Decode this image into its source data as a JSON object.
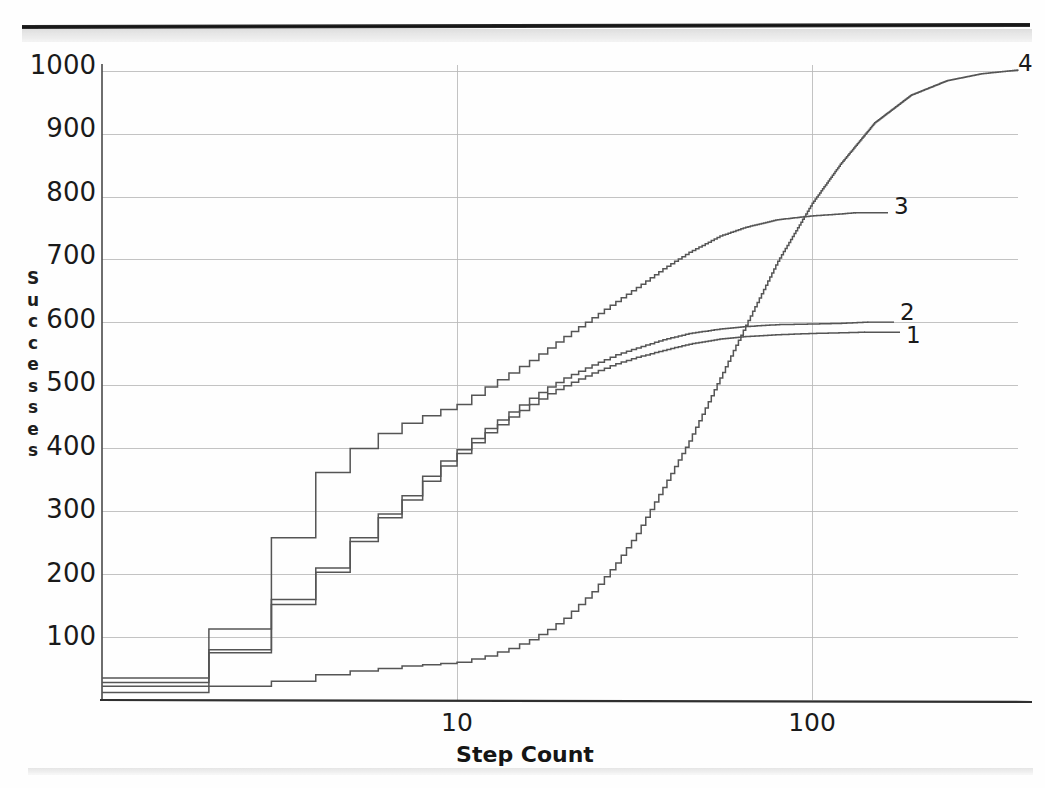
{
  "figure": {
    "type_name": "line-chart",
    "xlabel": "Step Count",
    "ylabel_letters": [
      "S",
      "u",
      "c",
      "c",
      "e",
      "s",
      "s",
      "e",
      "s"
    ],
    "ylabel_text": "Successes"
  },
  "axes": {
    "y_ticks": [
      "1000",
      "900",
      "800",
      "700",
      "600",
      "500",
      "400",
      "300",
      "200",
      "100"
    ],
    "x_ticks": [
      "10",
      "100"
    ]
  },
  "series_labels": {
    "one": "1",
    "two": "2",
    "three": "3",
    "four": "4"
  },
  "colors": {
    "ink": "#1a1a1a",
    "grid": "#b9b9b9",
    "axis": "#4a4a4a",
    "curve": "#555555",
    "paper": "#fefefe"
  },
  "chart_data": {
    "type": "line",
    "title": "",
    "subtitle": "",
    "xlabel": "Step Count",
    "ylabel": "Successes",
    "xscale": "log",
    "yscale": "linear",
    "xlim": [
      1,
      380
    ],
    "ylim": [
      0,
      1010
    ],
    "grid": true,
    "x_tick_values": [
      10,
      100
    ],
    "y_tick_values": [
      100,
      200,
      300,
      400,
      500,
      600,
      700,
      800,
      900,
      1000
    ],
    "legend_position": "right-of-line-ends",
    "annotations": [
      {
        "text": "1",
        "x": 145,
        "y": 585
      },
      {
        "text": "2",
        "x": 148,
        "y": 602
      },
      {
        "text": "3",
        "x": 135,
        "y": 775
      },
      {
        "text": "4",
        "x": 370,
        "y": 1000
      }
    ],
    "series": [
      {
        "name": "1",
        "label": "1",
        "x": [
          1,
          2,
          3,
          4,
          5,
          6,
          7,
          8,
          9,
          10,
          12,
          14,
          16,
          18,
          20,
          24,
          28,
          32,
          38,
          45,
          55,
          65,
          80,
          100,
          120,
          140
        ],
        "values": [
          22,
          75,
          152,
          203,
          252,
          290,
          318,
          348,
          372,
          392,
          425,
          450,
          470,
          487,
          500,
          520,
          535,
          545,
          556,
          566,
          574,
          578,
          581,
          583,
          584,
          585
        ]
      },
      {
        "name": "2",
        "label": "2",
        "x": [
          1,
          2,
          3,
          4,
          5,
          6,
          7,
          8,
          9,
          10,
          12,
          14,
          16,
          18,
          20,
          24,
          28,
          32,
          38,
          45,
          55,
          65,
          80,
          100,
          120,
          143
        ],
        "values": [
          28,
          80,
          160,
          210,
          258,
          296,
          325,
          356,
          380,
          398,
          432,
          458,
          480,
          498,
          512,
          533,
          549,
          560,
          573,
          583,
          590,
          594,
          597,
          598,
          599,
          601
        ]
      },
      {
        "name": "3",
        "label": "3",
        "x": [
          1,
          2,
          3,
          4,
          5,
          6,
          7,
          8,
          9,
          10,
          12,
          14,
          16,
          18,
          20,
          24,
          28,
          32,
          38,
          45,
          55,
          65,
          80,
          100,
          120,
          132
        ],
        "values": [
          35,
          113,
          258,
          362,
          400,
          424,
          440,
          452,
          462,
          470,
          498,
          520,
          540,
          560,
          578,
          608,
          634,
          656,
          686,
          712,
          738,
          752,
          764,
          770,
          773,
          775
        ]
      },
      {
        "name": "4",
        "label": "4",
        "x": [
          1,
          2,
          3,
          4,
          5,
          6,
          7,
          8,
          9,
          10,
          12,
          14,
          16,
          18,
          20,
          24,
          28,
          32,
          38,
          45,
          55,
          65,
          80,
          100,
          120,
          150,
          190,
          240,
          300,
          380
        ],
        "values": [
          12,
          22,
          30,
          40,
          46,
          50,
          54,
          56,
          58,
          60,
          70,
          82,
          96,
          112,
          130,
          172,
          218,
          265,
          338,
          412,
          512,
          596,
          698,
          790,
          852,
          918,
          962,
          985,
          996,
          1002
        ]
      }
    ]
  }
}
